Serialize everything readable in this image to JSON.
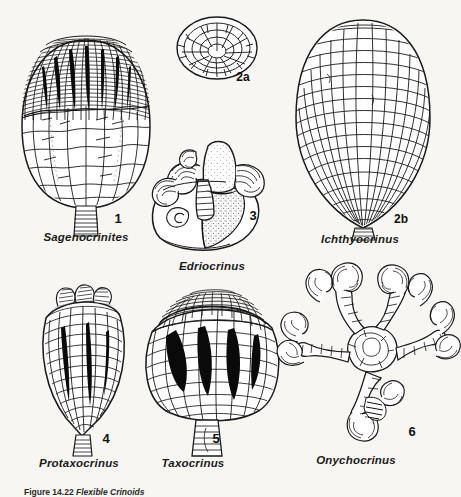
{
  "plate": {
    "background_color": "#f7f6f3",
    "ink_color": "#1a1a1a",
    "caption_prefix": "Figure",
    "caption_number": "14.22",
    "caption_text": "Flexible Crinoids"
  },
  "figures": [
    {
      "id": "sagenocrinites",
      "number": "1",
      "genus": "Sagenocrinites",
      "number_x": 118,
      "number_y": 218,
      "label_x": 86,
      "label_y": 238
    },
    {
      "id": "ichthyocrinus-oral",
      "number": "2a",
      "genus": "",
      "number_x": 243,
      "number_y": 77,
      "label_x": 0,
      "label_y": 0
    },
    {
      "id": "ichthyocrinus",
      "number": "2b",
      "genus": "Ichthyocrinus",
      "number_x": 401,
      "number_y": 219,
      "label_x": 360,
      "label_y": 240
    },
    {
      "id": "edriocrinus",
      "number": "3",
      "genus": "Edriocrinus",
      "number_x": 253,
      "number_y": 215,
      "label_x": 212,
      "label_y": 267
    },
    {
      "id": "protaxocrinus",
      "number": "4",
      "genus": "Protaxocrinus",
      "number_x": 106,
      "number_y": 438,
      "label_x": 79,
      "label_y": 464
    },
    {
      "id": "taxocrinus",
      "number": "5",
      "genus": "Taxocrinus",
      "number_x": 216,
      "number_y": 438,
      "label_x": 193,
      "label_y": 464
    },
    {
      "id": "onychocrinus",
      "number": "6",
      "genus": "Onychocrinus",
      "number_x": 412,
      "number_y": 431,
      "label_x": 356,
      "label_y": 461
    }
  ]
}
